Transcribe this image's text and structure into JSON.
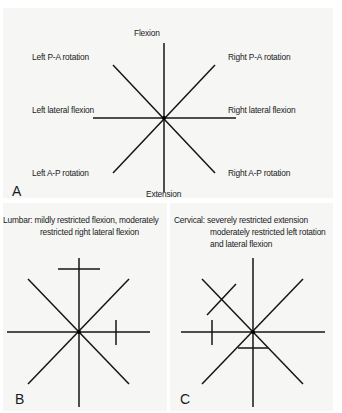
{
  "figure": {
    "panel_a": {
      "letter": "A",
      "labels": {
        "top": "Flexion",
        "bottom": "Extension",
        "upper_left": "Left P-A rotation",
        "upper_right": "Right P-A rotation",
        "middle_left": "Left lateral flexion",
        "middle_right": "Right lateral flexion",
        "lower_left": "Left A-P rotation",
        "lower_right": "Right A-P rotation"
      }
    },
    "panel_b": {
      "letter": "B",
      "caption_line1": "Lumbar: mildly restricted flexion, moderately",
      "caption_line2": "restricted right lateral flexion",
      "restrictions": [
        {
          "direction": "Flexion",
          "severity": "mild"
        },
        {
          "direction": "Right lateral flexion",
          "severity": "moderate"
        }
      ]
    },
    "panel_c": {
      "letter": "C",
      "caption_line1": "Cervical: severely restricted extension",
      "caption_line2": "moderately restricted left rotation",
      "caption_line3": "and lateral flexion",
      "restrictions": [
        {
          "direction": "Extension",
          "severity": "severe"
        },
        {
          "direction": "Left P-A rotation",
          "severity": "moderate"
        },
        {
          "direction": "Left lateral flexion",
          "severity": "moderate"
        }
      ]
    }
  }
}
